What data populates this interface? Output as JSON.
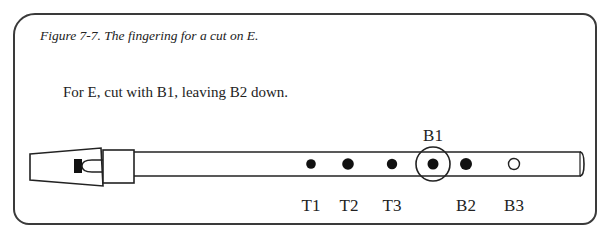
{
  "figure": {
    "caption": "Figure 7-7. The fingering for a cut on E.",
    "instruction": "For E, cut with B1, leaving B2 down."
  },
  "whistle": {
    "holes": [
      {
        "id": "T1",
        "label": "T1",
        "state": "closed",
        "x": 311
      },
      {
        "id": "T2",
        "label": "T2",
        "state": "closed",
        "x": 348
      },
      {
        "id": "T3",
        "label": "T3",
        "state": "closed",
        "x": 392
      },
      {
        "id": "B1",
        "label": "B1",
        "state": "closed",
        "x": 433,
        "highlighted": true
      },
      {
        "id": "B2",
        "label": "B2",
        "state": "closed",
        "x": 466
      },
      {
        "id": "B3",
        "label": "B3",
        "state": "open",
        "x": 514
      }
    ],
    "highlight_label": "B1",
    "colors": {
      "stroke": "#222222",
      "fill_closed": "#111111",
      "fill_open": "#ffffff"
    }
  },
  "labels": {
    "T1": "T1",
    "T2": "T2",
    "T3": "T3",
    "B1": "B1",
    "B2": "B2",
    "B3": "B3"
  }
}
